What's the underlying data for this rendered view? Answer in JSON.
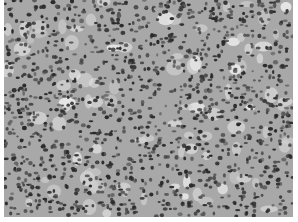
{
  "image": {
    "subject": "grayscale histology micrograph of densely packed cells",
    "palette": {
      "background": "#ffffff",
      "tissue": "#a8a8a8",
      "tissue_light": "#d0d0d0",
      "nuclei": "#2a2a2a",
      "nuclei_mid": "#555555"
    },
    "bounds": {
      "left": 4,
      "top": 0,
      "width": 289,
      "height": 217
    }
  }
}
